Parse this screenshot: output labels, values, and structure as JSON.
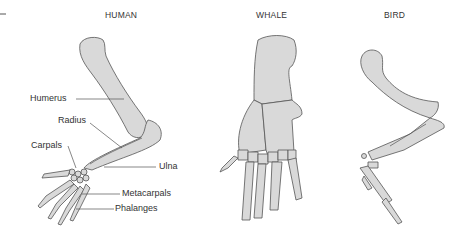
{
  "figure": {
    "panels": [
      {
        "title": "HUMAN"
      },
      {
        "title": "WHALE"
      },
      {
        "title": "BIRD"
      }
    ],
    "human_labels": [
      "Humerus",
      "Radius",
      "Carpals",
      "Ulna",
      "Metacarpals",
      "Phalanges"
    ],
    "colors": {
      "bone_fill": "#d9d9d9",
      "outline": "#555555",
      "text": "#333333"
    }
  }
}
